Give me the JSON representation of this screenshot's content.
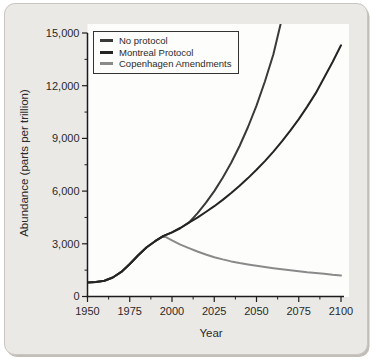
{
  "colors": {
    "card_bg": "#ebe9e6",
    "card_border": "#c9c6c1",
    "shadow": "#c2beb7",
    "plot_bg": "#fdfdfc",
    "axis": "#1c1c1c",
    "text": "#2a2a2a"
  },
  "chart_data": {
    "type": "line",
    "title": "",
    "xlabel": "Year",
    "ylabel": "Abundance (parts per trillion)",
    "x_range": [
      1950,
      2100
    ],
    "y_range": [
      0,
      15000
    ],
    "x_ticks": [
      1950,
      1975,
      2000,
      2025,
      2050,
      2075,
      2100
    ],
    "x_tick_labels": [
      "1950",
      "1975",
      "2000",
      "2025",
      "2050",
      "2075",
      "2100"
    ],
    "x_minor_ticks": [
      1962.5,
      1987.5,
      2012.5,
      2037.5,
      2062.5,
      2087.5
    ],
    "y_ticks": [
      0,
      3000,
      6000,
      9000,
      12000,
      15000
    ],
    "y_tick_labels": [
      "0",
      "3,000",
      "6,000",
      "9,000",
      "12,000",
      "15,000"
    ],
    "y_minor_ticks": [
      1500,
      4500,
      7500,
      10500,
      13500
    ],
    "grid": false,
    "legend_position": "top-left",
    "series": [
      {
        "name": "No protocol",
        "color": "#3a3a3a",
        "points": [
          [
            1950,
            800
          ],
          [
            1955,
            825
          ],
          [
            1960,
            900
          ],
          [
            1965,
            1080
          ],
          [
            1970,
            1400
          ],
          [
            1975,
            1850
          ],
          [
            1980,
            2350
          ],
          [
            1985,
            2800
          ],
          [
            1990,
            3150
          ],
          [
            1995,
            3450
          ],
          [
            2000,
            3650
          ],
          [
            2005,
            3900
          ],
          [
            2010,
            4200
          ],
          [
            2015,
            4730
          ],
          [
            2020,
            5330
          ],
          [
            2025,
            6000
          ],
          [
            2030,
            6760
          ],
          [
            2035,
            7610
          ],
          [
            2040,
            8570
          ],
          [
            2045,
            9650
          ],
          [
            2050,
            10870
          ],
          [
            2055,
            12240
          ],
          [
            2060,
            13790
          ],
          [
            2066,
            16200
          ]
        ]
      },
      {
        "name": "Montreal Protocol",
        "color": "#242424",
        "points": [
          [
            1950,
            800
          ],
          [
            1955,
            825
          ],
          [
            1960,
            900
          ],
          [
            1965,
            1080
          ],
          [
            1970,
            1400
          ],
          [
            1975,
            1850
          ],
          [
            1980,
            2350
          ],
          [
            1985,
            2800
          ],
          [
            1990,
            3150
          ],
          [
            1995,
            3450
          ],
          [
            2000,
            3650
          ],
          [
            2005,
            3900
          ],
          [
            2010,
            4200
          ],
          [
            2015,
            4490
          ],
          [
            2020,
            4810
          ],
          [
            2025,
            5140
          ],
          [
            2030,
            5500
          ],
          [
            2035,
            5890
          ],
          [
            2040,
            6300
          ],
          [
            2045,
            6740
          ],
          [
            2050,
            7210
          ],
          [
            2055,
            7710
          ],
          [
            2060,
            8250
          ],
          [
            2065,
            8830
          ],
          [
            2070,
            9440
          ],
          [
            2075,
            10100
          ],
          [
            2080,
            10810
          ],
          [
            2085,
            11560
          ],
          [
            2090,
            12450
          ],
          [
            2095,
            13350
          ],
          [
            2100,
            14300
          ]
        ]
      },
      {
        "name": "Copenhagen Amendments",
        "color": "#8a8a8a",
        "points": [
          [
            1950,
            800
          ],
          [
            1955,
            825
          ],
          [
            1960,
            900
          ],
          [
            1965,
            1080
          ],
          [
            1970,
            1400
          ],
          [
            1975,
            1850
          ],
          [
            1980,
            2350
          ],
          [
            1985,
            2800
          ],
          [
            1990,
            3150
          ],
          [
            1995,
            3450
          ],
          [
            2000,
            3200
          ],
          [
            2005,
            2950
          ],
          [
            2010,
            2750
          ],
          [
            2015,
            2560
          ],
          [
            2020,
            2390
          ],
          [
            2025,
            2240
          ],
          [
            2030,
            2110
          ],
          [
            2035,
            2000
          ],
          [
            2040,
            1900
          ],
          [
            2045,
            1820
          ],
          [
            2050,
            1750
          ],
          [
            2055,
            1680
          ],
          [
            2060,
            1610
          ],
          [
            2065,
            1550
          ],
          [
            2070,
            1490
          ],
          [
            2075,
            1440
          ],
          [
            2080,
            1380
          ],
          [
            2085,
            1330
          ],
          [
            2090,
            1290
          ],
          [
            2095,
            1240
          ],
          [
            2100,
            1200
          ]
        ]
      }
    ]
  }
}
